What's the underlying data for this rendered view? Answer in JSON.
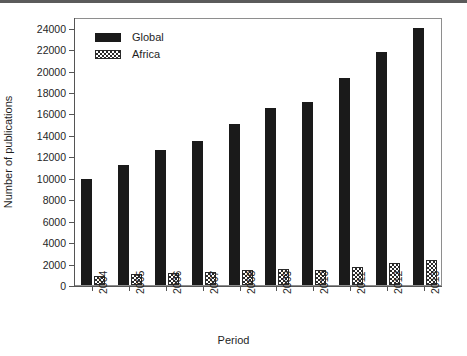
{
  "chart_data": {
    "type": "bar",
    "title": "",
    "xlabel": "Period",
    "ylabel": "Number of publications",
    "categories": [
      "2004",
      "2005",
      "2006",
      "2007",
      "2008",
      "2009",
      "2010",
      "2011",
      "2012",
      "2013"
    ],
    "series": [
      {
        "name": "Global",
        "values": [
          9900,
          11200,
          12600,
          13400,
          15000,
          16500,
          17100,
          19300,
          21700,
          24000
        ]
      },
      {
        "name": "Africa",
        "values": [
          800,
          1000,
          1150,
          1250,
          1400,
          1500,
          1400,
          1700,
          2050,
          2300
        ]
      }
    ],
    "ylim": [
      0,
      25000
    ],
    "ytick_labels": [
      "0",
      "2000",
      "4000",
      "6000",
      "8000",
      "10000",
      "12000",
      "14000",
      "16000",
      "18000",
      "20000",
      "22000",
      "24000"
    ],
    "ytick_values": [
      0,
      2000,
      4000,
      6000,
      8000,
      10000,
      12000,
      14000,
      16000,
      18000,
      20000,
      22000,
      24000
    ],
    "grid": false,
    "legend_position": "upper-left",
    "legend_entries": [
      "Global",
      "Africa"
    ],
    "colors": {
      "global": "#1a1a1a",
      "africa": "#2a2a2a",
      "axis": "#555555",
      "background": "#ffffff"
    }
  }
}
